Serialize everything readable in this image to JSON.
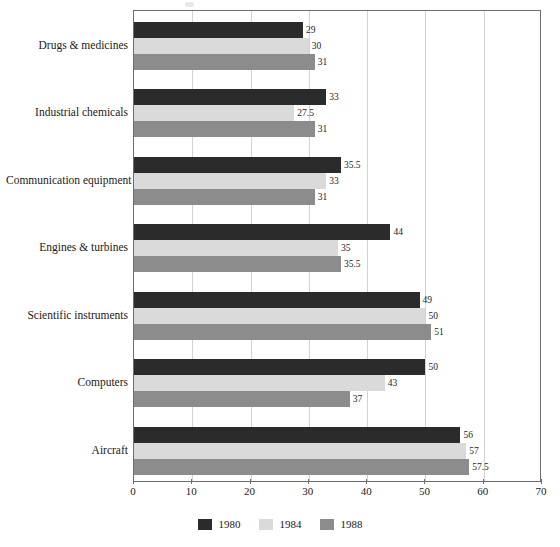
{
  "chart_data": {
    "type": "bar",
    "orientation": "horizontal",
    "title": "",
    "subtitle": "",
    "xlabel": "",
    "ylabel": "",
    "xlim": [
      0,
      70
    ],
    "xticks": [
      0,
      10,
      20,
      30,
      40,
      50,
      60,
      70
    ],
    "xtick_labels": [
      "0",
      "10",
      "20",
      "30",
      "40",
      "50",
      "60",
      "70"
    ],
    "grid": "vertical",
    "legend_position": "bottom-center",
    "categories": [
      "Drugs & medicines",
      "Industrial chemicals",
      "Communication equipment",
      "Engines & turbines",
      "Scientific instruments",
      "Computers",
      "Aircraft"
    ],
    "series": [
      {
        "name": "1980",
        "color": "#2b2b2b",
        "values": [
          29,
          33,
          35.5,
          44,
          49,
          50,
          56
        ],
        "value_labels": [
          "29",
          "33",
          "35.5",
          "44",
          "49",
          "50",
          "56"
        ]
      },
      {
        "name": "1984",
        "color": "#dadada",
        "values": [
          30,
          27.5,
          33,
          35,
          50,
          43,
          57
        ],
        "value_labels": [
          "30",
          "27.5",
          "33",
          "35",
          "50",
          "43",
          "57"
        ]
      },
      {
        "name": "1988",
        "color": "#8c8c8c",
        "values": [
          31,
          31,
          31,
          35.5,
          51,
          37,
          57.5
        ],
        "value_labels": [
          "31",
          "31",
          "31",
          "35.5",
          "51",
          "37",
          "57.5"
        ]
      }
    ]
  },
  "colors": {
    "series_1980": "#2b2b2b",
    "series_1984": "#dadada",
    "series_1988": "#8c8c8c",
    "frame": "#6d6d6d",
    "gridline": "#d2d2d2",
    "text": "#1a1a1a",
    "background": "#ffffff"
  }
}
